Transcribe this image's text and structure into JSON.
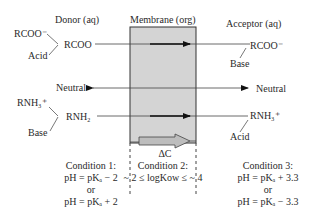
{
  "headers": {
    "donor": "Donor (aq)",
    "membrane": "Membrane (org)",
    "acceptor": "Acceptor (aq)"
  },
  "donor": {
    "rcoo_ion": "RCOO⁻",
    "acid": "Acid",
    "rcoo": "RCOO",
    "neutral": "Neutral",
    "rnh3_ion": "RNH₃⁺",
    "base": "Base",
    "rnh2": "RNH₂"
  },
  "acceptor": {
    "rcoo_ion": "RCOO⁻",
    "base": "Base",
    "neutral": "Neutral",
    "rnh3_ion": "RNH₃⁺",
    "acid": "Acid"
  },
  "membrane": {
    "delta_c": "ΔC",
    "fill_color": "#d4d4d4"
  },
  "conditions": [
    {
      "title": "Condition 1:",
      "line1": "pH = pKₐ − 2",
      "or": "or",
      "line2": "pH = pKₐ + 2"
    },
    {
      "title": "Condition 2:",
      "line1": "~ 2 ≤ logKow ≤ ~ 4"
    },
    {
      "title": "Condition 3:",
      "line1": "pH = pKₐ + 3.3",
      "or": "or",
      "line2": "pH = pKₐ − 3.3"
    }
  ]
}
